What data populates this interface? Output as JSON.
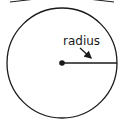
{
  "diagram": {
    "label": "radius",
    "circle": {
      "cx": 62,
      "cy": 63,
      "r": 55
    },
    "colors": {
      "stroke": "#1a1a1a",
      "background": "#ffffff"
    }
  }
}
